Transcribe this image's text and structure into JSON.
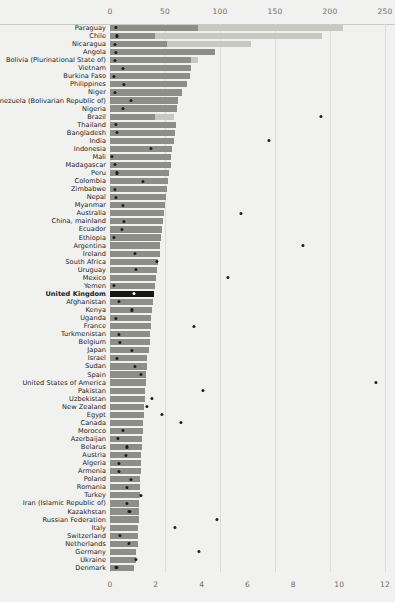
{
  "chart_data": {
    "type": "bar",
    "title": "",
    "subtitle": "",
    "xlabel": "",
    "ylabel": "",
    "orientation": "horizontal",
    "grid": true,
    "legend_position": "none",
    "top_axis": {
      "name": "primary-axis-top",
      "ticks": [
        0,
        50,
        100,
        150,
        200,
        250
      ],
      "tick_labels": [
        "0",
        "50",
        "100",
        "150",
        "200",
        "250"
      ],
      "range": [
        0,
        250
      ]
    },
    "bottom_axis": {
      "name": "secondary-axis-bottom",
      "ticks": [
        0,
        2,
        4,
        6,
        8,
        10,
        12
      ],
      "tick_labels": [
        "0",
        "2",
        "4",
        "6",
        "8",
        "10",
        "12"
      ],
      "range": [
        0,
        12
      ]
    },
    "series": [
      {
        "name": "bar-dark-segment",
        "color": "#8e8e88",
        "axis": "top"
      },
      {
        "name": "bar-light-segment",
        "color": "#c8c8c2",
        "axis": "top"
      },
      {
        "name": "dot-marker",
        "color": "#1d1d20",
        "axis": "bottom"
      }
    ],
    "highlight_category": "United Kingdom",
    "highlight_color": "#17171a",
    "categories": [
      "Paraguay",
      "Chile",
      "Nicaragua",
      "Angola",
      "Bolivia (Plurinational State of)",
      "Vietnam",
      "Burkina Faso",
      "Philippines",
      "Niger",
      "Venezuela (Bolivarian Republic of)",
      "Nigeria",
      "Brazil",
      "Thailand",
      "Bangladesh",
      "India",
      "Indonesia",
      "Mali",
      "Madagascar",
      "Peru",
      "Colombia",
      "Zimbabwe",
      "Nepal",
      "Myanmar",
      "Australia",
      "China, mainland",
      "Ecuador",
      "Ethiopia",
      "Argentina",
      "Ireland",
      "South Africa",
      "Uruguay",
      "Mexico",
      "Yemen",
      "United Kingdom",
      "Afghanistan",
      "Kenya",
      "Uganda",
      "France",
      "Turkmenistan",
      "Belgium",
      "Japan",
      "Israel",
      "Sudan",
      "Spain",
      "United States of America",
      "Pakistan",
      "Uzbekistan",
      "New Zealand",
      "Egypt",
      "Canada",
      "Morocco",
      "Azerbaijan",
      "Belarus",
      "Austria",
      "Algeria",
      "Armenia",
      "Poland",
      "Romania",
      "Turkey",
      "Iran (Islamic Republic of)",
      "Kazakhstan",
      "Russian Federation",
      "Italy",
      "Switzerland",
      "Netherlands",
      "Germany",
      "Ukraine",
      "Denmark"
    ],
    "dark_values": [
      80,
      41,
      52,
      95,
      74,
      74,
      73,
      70,
      65,
      62,
      61,
      41,
      60,
      59,
      58,
      56,
      55,
      55,
      54,
      53,
      52,
      51,
      50,
      49,
      48,
      47,
      46,
      45,
      45,
      44,
      43,
      42,
      41,
      40,
      39,
      38,
      37,
      37,
      36,
      36,
      35,
      34,
      34,
      33,
      33,
      32,
      32,
      31,
      31,
      30,
      30,
      29,
      29,
      28,
      28,
      28,
      27,
      27,
      27,
      26,
      26,
      26,
      25,
      25,
      25,
      24,
      24,
      22
    ],
    "light_values": [
      212,
      193,
      128,
      95,
      80,
      74,
      73,
      70,
      65,
      62,
      61,
      58,
      60,
      59,
      58,
      56,
      55,
      55,
      54,
      53,
      52,
      51,
      50,
      49,
      48,
      47,
      46,
      45,
      45,
      44,
      43,
      42,
      41,
      40,
      39,
      38,
      37,
      37,
      36,
      36,
      35,
      34,
      34,
      33,
      33,
      32,
      32,
      31,
      31,
      30,
      30,
      29,
      29,
      28,
      28,
      28,
      27,
      27,
      27,
      26,
      26,
      26,
      25,
      25,
      25,
      24,
      24,
      22
    ],
    "dot_values": [
      0.25,
      0.3,
      0.2,
      0.25,
      0.22,
      0.55,
      0.18,
      0.6,
      0.22,
      0.9,
      0.58,
      9.2,
      0.25,
      0.32,
      6.95,
      1.8,
      0.1,
      0.22,
      0.3,
      1.45,
      0.2,
      0.25,
      0.55,
      5.7,
      0.6,
      0.52,
      0.18,
      8.4,
      1.1,
      2.05,
      1.15,
      5.15,
      0.18,
      1.05,
      0.38,
      0.95,
      0.25,
      3.65,
      0.4,
      0.45,
      0.95,
      0.3,
      1.1,
      1.35,
      11.6,
      4.05,
      1.85,
      1.6,
      2.25,
      3.1,
      0.55,
      0.35,
      0.72,
      0.68,
      0.4,
      0.38,
      0.9,
      0.72,
      1.35,
      0.75,
      0.85,
      4.65,
      2.85,
      0.45,
      0.82,
      3.9,
      1.15,
      0.28
    ]
  }
}
